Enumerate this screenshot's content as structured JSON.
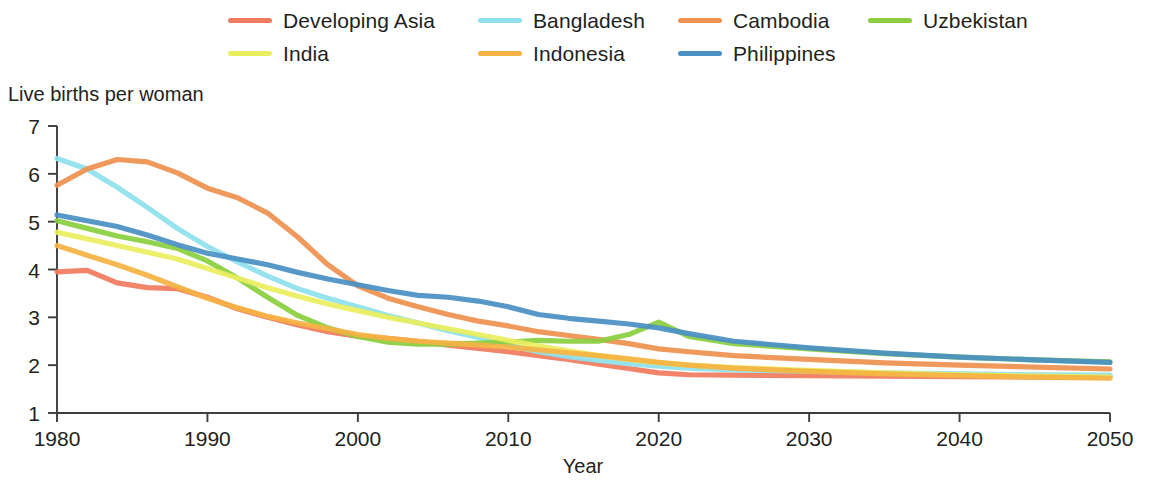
{
  "chart_data": {
    "type": "line",
    "title": "",
    "xlabel": "Year",
    "ylabel": "Live births per woman",
    "xlim": [
      1980,
      2050
    ],
    "ylim": [
      1,
      7
    ],
    "xticks": [
      1980,
      1990,
      2000,
      2010,
      2020,
      2030,
      2040,
      2050
    ],
    "yticks": [
      1,
      2,
      3,
      4,
      5,
      6,
      7
    ],
    "grid": false,
    "legend_position": "top",
    "x": [
      1980,
      1982,
      1984,
      1986,
      1988,
      1990,
      1992,
      1994,
      1996,
      1998,
      2000,
      2002,
      2004,
      2006,
      2008,
      2010,
      2012,
      2014,
      2016,
      2018,
      2020,
      2022,
      2025,
      2030,
      2035,
      2040,
      2045,
      2050
    ],
    "series": [
      {
        "name": "Developing Asia",
        "color": "#F07B5E",
        "values": [
          3.95,
          3.98,
          3.72,
          3.62,
          3.6,
          3.42,
          3.18,
          3.0,
          2.84,
          2.7,
          2.6,
          2.56,
          2.5,
          2.42,
          2.35,
          2.28,
          2.2,
          2.12,
          2.02,
          1.93,
          1.84,
          1.8,
          1.79,
          1.78,
          1.77,
          1.76,
          1.75,
          1.75
        ]
      },
      {
        "name": "Bangladesh",
        "color": "#8EE0EC",
        "values": [
          6.32,
          6.1,
          5.72,
          5.3,
          4.86,
          4.48,
          4.16,
          3.86,
          3.6,
          3.4,
          3.22,
          3.04,
          2.88,
          2.72,
          2.58,
          2.42,
          2.28,
          2.18,
          2.1,
          2.03,
          1.98,
          1.94,
          1.9,
          1.87,
          1.84,
          1.82,
          1.8,
          1.79
        ]
      },
      {
        "name": "Cambodia",
        "color": "#EE9250",
        "values": [
          5.76,
          6.1,
          6.3,
          6.25,
          6.02,
          5.7,
          5.5,
          5.18,
          4.68,
          4.1,
          3.66,
          3.4,
          3.22,
          3.06,
          2.92,
          2.82,
          2.7,
          2.62,
          2.54,
          2.45,
          2.34,
          2.28,
          2.2,
          2.12,
          2.05,
          2.0,
          1.96,
          1.92
        ]
      },
      {
        "name": "Uzbekistan",
        "color": "#8BCF3F",
        "values": [
          5.02,
          4.86,
          4.7,
          4.58,
          4.44,
          4.18,
          3.82,
          3.42,
          3.04,
          2.78,
          2.6,
          2.48,
          2.44,
          2.44,
          2.46,
          2.48,
          2.52,
          2.5,
          2.5,
          2.64,
          2.9,
          2.6,
          2.45,
          2.34,
          2.24,
          2.17,
          2.11,
          2.07
        ]
      },
      {
        "name": "India",
        "color": "#E9EE5E",
        "values": [
          4.78,
          4.64,
          4.5,
          4.36,
          4.22,
          4.02,
          3.82,
          3.62,
          3.44,
          3.28,
          3.14,
          3.0,
          2.88,
          2.76,
          2.64,
          2.52,
          2.4,
          2.3,
          2.2,
          2.12,
          2.05,
          2.0,
          1.95,
          1.89,
          1.84,
          1.8,
          1.77,
          1.75
        ]
      },
      {
        "name": "Indonesia",
        "color": "#F5B344",
        "values": [
          4.5,
          4.3,
          4.1,
          3.88,
          3.64,
          3.4,
          3.2,
          3.02,
          2.88,
          2.76,
          2.64,
          2.56,
          2.5,
          2.46,
          2.42,
          2.38,
          2.32,
          2.26,
          2.2,
          2.13,
          2.06,
          2.0,
          1.94,
          1.87,
          1.82,
          1.78,
          1.75,
          1.73
        ]
      },
      {
        "name": "Philippines",
        "color": "#4A90C4",
        "values": [
          5.14,
          5.02,
          4.9,
          4.72,
          4.52,
          4.34,
          4.22,
          4.1,
          3.94,
          3.8,
          3.68,
          3.56,
          3.46,
          3.42,
          3.34,
          3.22,
          3.06,
          2.98,
          2.92,
          2.86,
          2.78,
          2.66,
          2.5,
          2.36,
          2.25,
          2.17,
          2.11,
          2.06
        ]
      }
    ]
  },
  "legend": {
    "items": [
      {
        "label": "Developing Asia",
        "color": "#F07B5E",
        "col": 1,
        "row": 1
      },
      {
        "label": "Bangladesh",
        "color": "#8EE0EC",
        "col": 2,
        "row": 1
      },
      {
        "label": "Cambodia",
        "color": "#EE9250",
        "col": 3,
        "row": 1
      },
      {
        "label": "Uzbekistan",
        "color": "#8BCF3F",
        "col": 4,
        "row": 1
      },
      {
        "label": "India",
        "color": "#E9EE5E",
        "col": 1,
        "row": 2
      },
      {
        "label": "Indonesia",
        "color": "#F5B344",
        "col": 2,
        "row": 2
      },
      {
        "label": "Philippines",
        "color": "#4A90C4",
        "col": 3,
        "row": 2
      }
    ]
  },
  "axes": {
    "y_title": "Live births per woman",
    "x_title": "Year"
  }
}
